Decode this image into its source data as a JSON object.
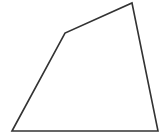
{
  "diagram": {
    "shape": "quadrilateral",
    "stroke_color": "#333333",
    "fill_color": "#ffffff",
    "stroke_width": 1.6,
    "vertices": [
      {
        "x": 12,
        "y": 131
      },
      {
        "x": 65,
        "y": 33
      },
      {
        "x": 132,
        "y": 3
      },
      {
        "x": 158,
        "y": 131
      }
    ]
  }
}
